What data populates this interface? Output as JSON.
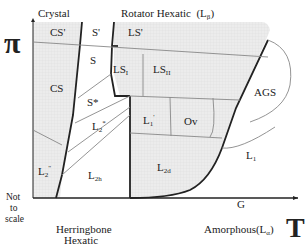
{
  "axes": {
    "y_symbol": "π",
    "x_symbol": "T",
    "scale_note": [
      "Not",
      "to",
      "scale"
    ]
  },
  "top_labels": {
    "crystal": "Crystal",
    "rotator_hexatic": "Rotator Hexatic",
    "rotator_hexatic_phase": "(L",
    "rotator_hexatic_sub": "β",
    "rotator_hexatic_close": ")"
  },
  "bottom_labels": {
    "herringbone_line1": "Herringbone",
    "herringbone_line2": "Hexatic",
    "amorphous": "Amorphous",
    "amorphous_phase": "(L",
    "amorphous_sub": "α",
    "amorphous_close": ")"
  },
  "phases": {
    "CS_prime": "CS'",
    "S_prime": "S'",
    "LS_prime": "LS'",
    "S": "S",
    "LS_I": "LS",
    "LS_I_sub": "I",
    "LS_II": "LS",
    "LS_II_sub": "II",
    "CS": "CS",
    "S_star": "S*",
    "L2_star": "L",
    "L2_star_sub": "2",
    "L2_star_sup": "*",
    "L1_prime": "L",
    "L1_prime_sub": "1",
    "L1_prime_sup": "'",
    "Ov": "Ov",
    "AGS": "AGS",
    "L2_dprime": "L",
    "L2_dprime_sub": "2",
    "L2_dprime_sup": "\"",
    "L2h": "L",
    "L2h_sub": "2h",
    "L2d": "L",
    "L2d_sub": "2d",
    "L1": "L",
    "L1_sub": "1",
    "G": "G"
  },
  "colors": {
    "shaded": "#e6e6e6",
    "line_thick": "#222222",
    "line_thin": "#777777"
  }
}
